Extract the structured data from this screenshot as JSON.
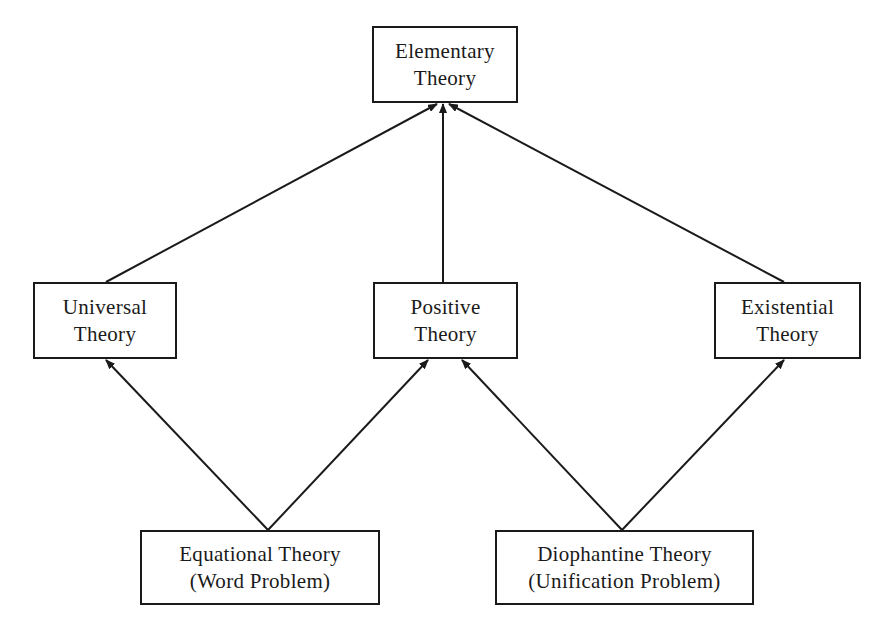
{
  "diagram": {
    "type": "hierarchy",
    "stroke_color": "#1a1a1a",
    "background": "#ffffff",
    "nodes": [
      {
        "id": "elementary",
        "lines": [
          "Elementary",
          "Theory"
        ]
      },
      {
        "id": "universal",
        "lines": [
          "Universal",
          "Theory"
        ]
      },
      {
        "id": "positive",
        "lines": [
          "Positive",
          "Theory"
        ]
      },
      {
        "id": "existential",
        "lines": [
          "Existential",
          "Theory"
        ]
      },
      {
        "id": "equational",
        "lines": [
          "Equational Theory",
          "(Word Problem)"
        ]
      },
      {
        "id": "diophantine",
        "lines": [
          "Diophantine Theory",
          "(Unification Problem)"
        ]
      }
    ],
    "edges": [
      {
        "from": "universal",
        "to": "elementary"
      },
      {
        "from": "positive",
        "to": "elementary"
      },
      {
        "from": "existential",
        "to": "elementary"
      },
      {
        "from": "equational",
        "to": "universal"
      },
      {
        "from": "equational",
        "to": "positive"
      },
      {
        "from": "diophantine",
        "to": "positive"
      },
      {
        "from": "diophantine",
        "to": "existential"
      }
    ]
  }
}
